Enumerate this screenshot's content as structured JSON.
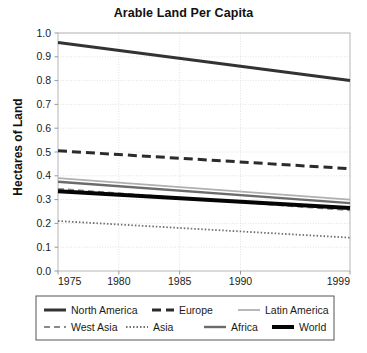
{
  "chart_data": {
    "type": "line",
    "title": "Arable Land Per Capita",
    "xlabel": "",
    "ylabel": "Hectares of Land",
    "xlim": [
      1975,
      1999
    ],
    "ylim": [
      0.0,
      1.0
    ],
    "xticks": [
      "1975",
      "1980",
      "1985",
      "1990",
      "1999"
    ],
    "xtick_values": [
      1975,
      1980,
      1985,
      1990,
      1999
    ],
    "yticks": [
      "0.0",
      "0.1",
      "0.2",
      "0.3",
      "0.4",
      "0.5",
      "0.6",
      "0.7",
      "0.8",
      "0.9",
      "1.0"
    ],
    "ytick_values": [
      0.0,
      0.1,
      0.2,
      0.3,
      0.4,
      0.5,
      0.6,
      0.7,
      0.8,
      0.9,
      1.0
    ],
    "grid": true,
    "grid_color": "#d9d9d9",
    "legend_position": "below",
    "x": [
      1975,
      1999
    ],
    "series": [
      {
        "name": "North America",
        "values": [
          0.96,
          0.8
        ],
        "color": "#333333",
        "style": "solid",
        "width": 3.0,
        "dash": ""
      },
      {
        "name": "Europe",
        "values": [
          0.505,
          0.43
        ],
        "color": "#2b2b2b",
        "style": "dashed",
        "width": 3.0,
        "dash": "9,5"
      },
      {
        "name": "Latin America",
        "values": [
          0.39,
          0.3
        ],
        "color": "#b0b0b0",
        "style": "solid",
        "width": 1.8,
        "dash": ""
      },
      {
        "name": "West Asia",
        "values": [
          0.345,
          0.255
        ],
        "color": "#8a8a8a",
        "style": "dashed",
        "width": 2.0,
        "dash": "6,4"
      },
      {
        "name": "Asia",
        "values": [
          0.21,
          0.14
        ],
        "color": "#6e6e6e",
        "style": "dotted",
        "width": 1.8,
        "dash": "1.5,2"
      },
      {
        "name": "Africa",
        "values": [
          0.375,
          0.285
        ],
        "color": "#6b6b6b",
        "style": "solid",
        "width": 2.4,
        "dash": ""
      },
      {
        "name": "World",
        "values": [
          0.335,
          0.265
        ],
        "color": "#050505",
        "style": "solid",
        "width": 4.0,
        "dash": ""
      }
    ]
  },
  "legend": {
    "rows": [
      [
        "North America",
        "Europe",
        "Latin America"
      ],
      [
        "West Asia",
        "Asia",
        "Africa",
        "World"
      ]
    ]
  }
}
